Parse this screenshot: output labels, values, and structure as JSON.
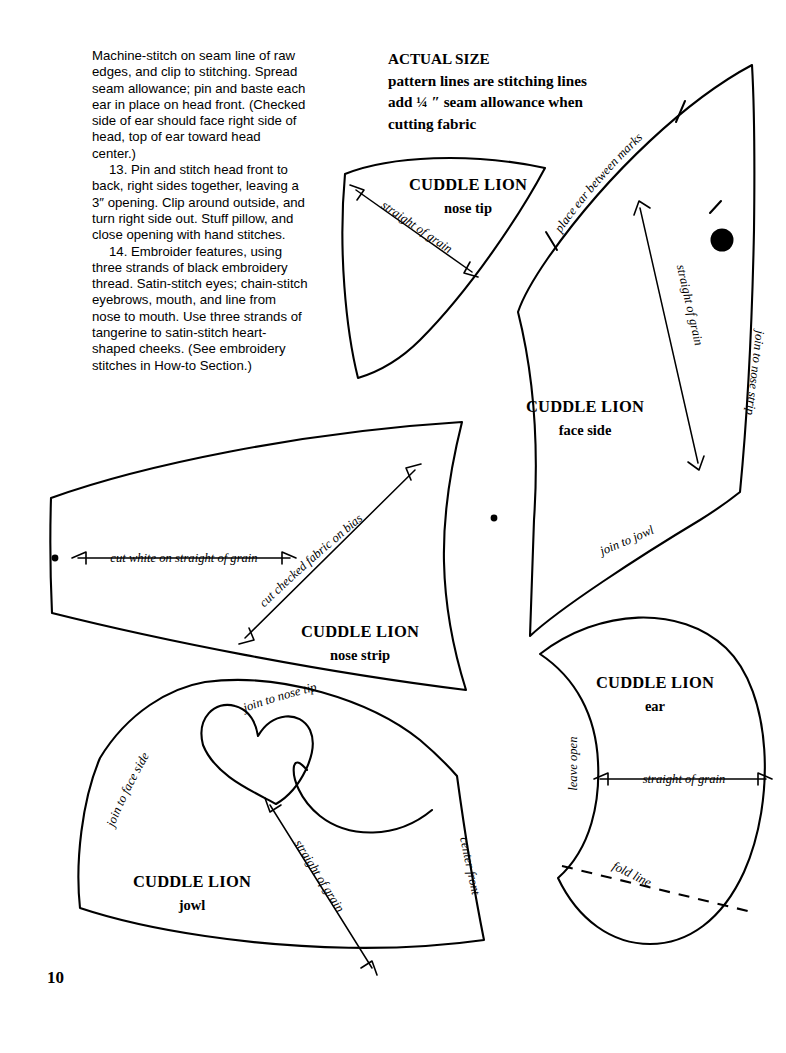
{
  "page": {
    "number": "10",
    "background_color": "#ffffff",
    "ink_color": "#000000"
  },
  "instructions": {
    "paragraphs": [
      "Machine-stitch on seam line of raw edges, and clip to stitching. Spread seam allowance; pin and baste each ear in place on head front. (Checked side of ear should face right side of head, top of ear toward head center.)",
      "13. Pin and stitch head front to back, right sides together, leaving a 3″ opening. Clip around outside, and turn right side out. Stuff pillow, and close opening with hand stitches.",
      "14. Embroider features, using three strands of black embroidery thread. Satin-stitch eyes; chain-stitch eyebrows, mouth, and line from nose to mouth. Use three strands of tangerine to satin-stitch heart-shaped cheeks. (See embroidery stitches in How-to Section.)"
    ]
  },
  "header_note": {
    "line1": "ACTUAL SIZE",
    "line2": "pattern lines are stitching lines",
    "line3": "add ¼ ″ seam allowance when",
    "line4": "cutting fabric"
  },
  "pieces": {
    "nose_tip": {
      "title": "CUDDLE LION",
      "subtitle": "nose tip",
      "grain_label": "straight of grain"
    },
    "face_side": {
      "title": "CUDDLE LION",
      "subtitle": "face side",
      "grain_label": "straight of grain",
      "edge_label_top": "place ear between marks",
      "edge_label_right": "join to nose strip",
      "edge_label_bottom": "join to jowl"
    },
    "nose_strip": {
      "title": "CUDDLE LION",
      "subtitle": "nose strip",
      "grain_label_horizontal": "cut white on straight of grain",
      "grain_label_bias": "cut checked fabric on bias"
    },
    "jowl": {
      "title": "CUDDLE LION",
      "subtitle": "jowl",
      "grain_label": "straight of grain",
      "edge_label_left": "join to face side",
      "edge_label_top": "join to nose tip",
      "edge_label_right": "center front"
    },
    "ear": {
      "title": "CUDDLE LION",
      "subtitle": "ear",
      "grain_label": "straight of grain",
      "edge_label_left": "leave open",
      "fold_label": "fold line"
    }
  }
}
